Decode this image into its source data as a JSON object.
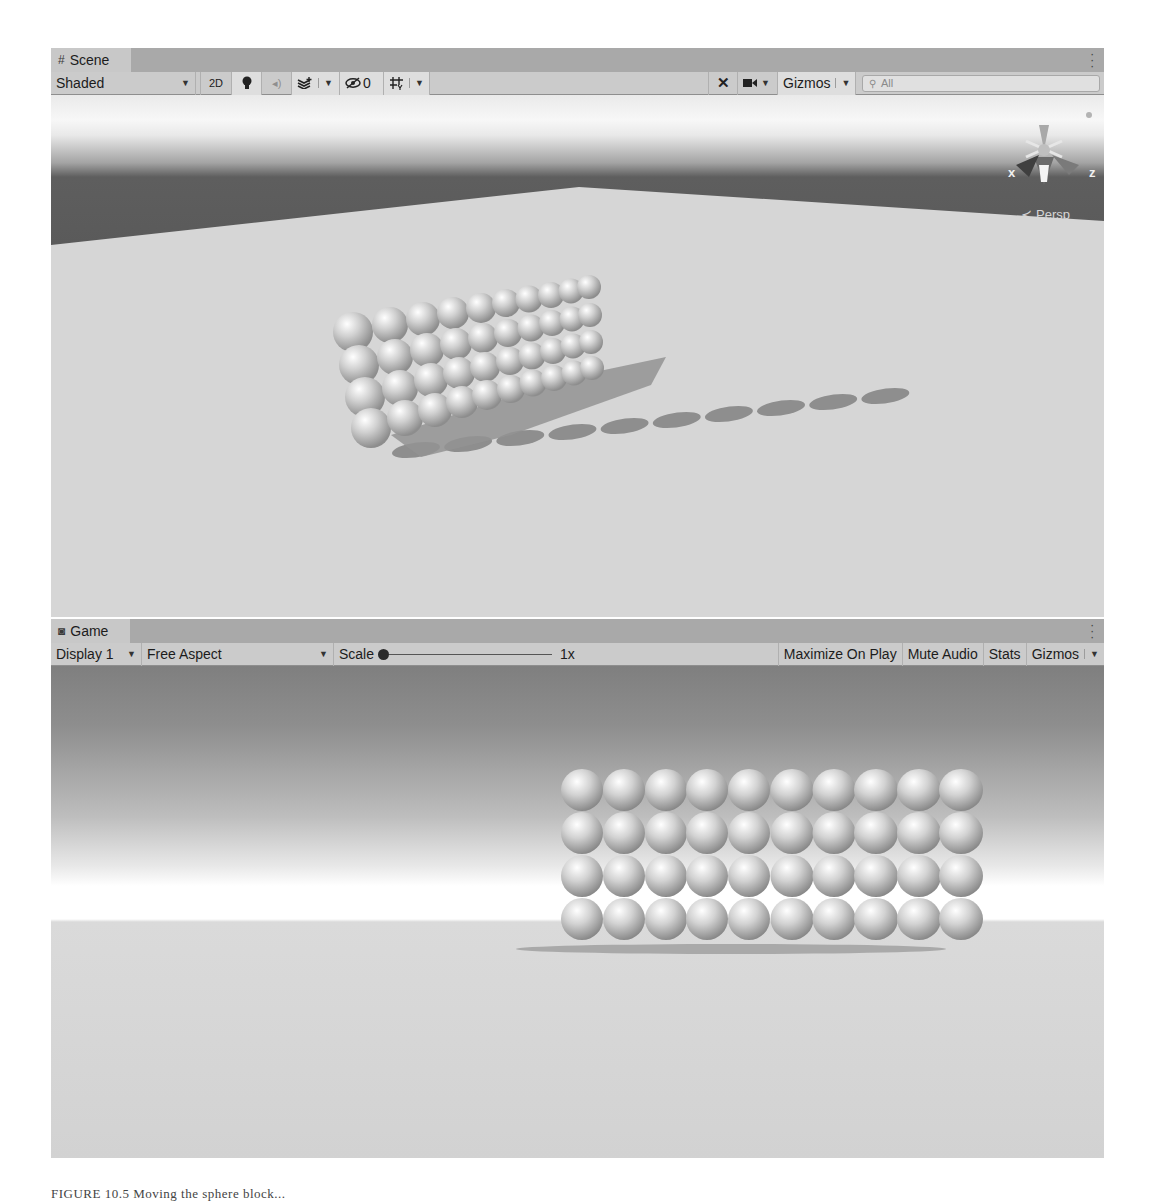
{
  "scene_panel": {
    "tab": {
      "label": "Scene",
      "icon": "grid-hash-icon"
    },
    "toolbar": {
      "draw_mode": "Shaded",
      "mode_2d": "2D",
      "lighting_icon": "lightbulb-icon",
      "audio_icon": "speaker-icon",
      "effects_icon": "layers-effects-icon",
      "hidden_count": "0",
      "hidden_icon": "eye-slash-icon",
      "grid_icon": "grid-snap-icon",
      "tools_icon": "tools-cross-icon",
      "camera_icon": "camera-icon",
      "gizmos_label": "Gizmos",
      "search_placeholder": "All",
      "search_icon": "search-icon"
    },
    "view": {
      "gizmo_axes": {
        "x": "x",
        "z": "z"
      },
      "projection_label": "Persp",
      "sphere_grid": {
        "columns": 10,
        "rows": 4
      }
    }
  },
  "game_panel": {
    "tab": {
      "label": "Game",
      "icon": "gamepad-icon"
    },
    "toolbar": {
      "display": "Display 1",
      "aspect": "Free Aspect",
      "scale_label": "Scale",
      "scale_value": "1x",
      "maximize_on_play": "Maximize On Play",
      "mute_audio": "Mute Audio",
      "stats": "Stats",
      "gizmos": "Gizmos"
    },
    "view": {
      "sphere_grid": {
        "columns": 10,
        "rows": 4
      }
    }
  },
  "caption": "FIGURE 10.5  Moving the sphere block..."
}
